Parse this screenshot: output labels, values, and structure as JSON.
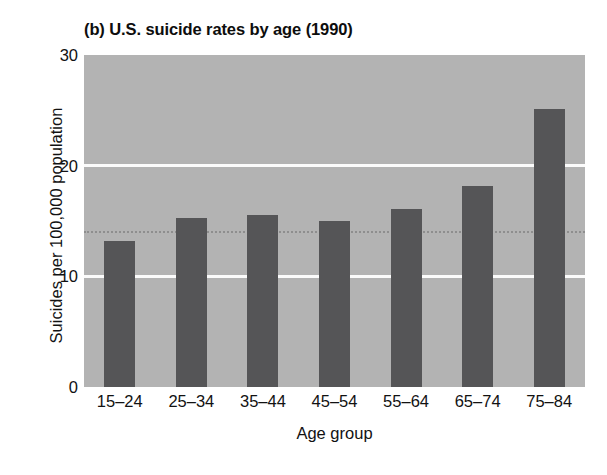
{
  "chart_data": {
    "type": "bar",
    "title": "(b) U.S. suicide rates by age (1990)",
    "xlabel": "Age group",
    "ylabel": "Suicides per 100,000 population",
    "categories": [
      "15–24",
      "25–34",
      "35–44",
      "45–54",
      "55–64",
      "65–74",
      "75–84"
    ],
    "values": [
      13.2,
      15.3,
      15.5,
      15.0,
      16.1,
      18.2,
      25.1
    ],
    "ylim": [
      0,
      30
    ],
    "yticks": [
      0,
      10,
      20,
      30
    ],
    "ytick_labels": [
      "0",
      "10",
      "20",
      "30"
    ],
    "xlim_note": "categorical",
    "grid": "horizontal white gridlines at 10 and 20",
    "legend": "none",
    "annotations": [
      {
        "type": "reference-line",
        "orientation": "horizontal",
        "value": 14.0,
        "style": "dotted",
        "label": ""
      }
    ],
    "colors": {
      "plot_background": "#b3b3b3",
      "bar_fill": "#555557",
      "gridline": "#fbfbfb",
      "reference_line": "#8e8e8e",
      "text": "#121212",
      "page_background": "#ffffff"
    }
  }
}
